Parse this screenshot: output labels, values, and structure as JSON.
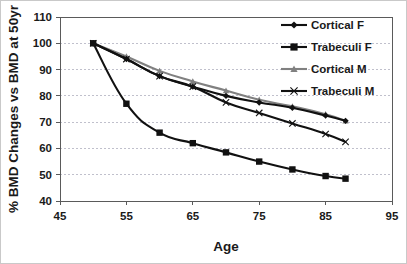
{
  "chart_data": {
    "type": "line",
    "title": "",
    "xlabel": "Age",
    "ylabel": "% BMD Changes vs BMD at 50yr",
    "xlim": [
      45,
      95
    ],
    "ylim": [
      40,
      110
    ],
    "xticks": [
      45,
      55,
      65,
      75,
      85,
      95
    ],
    "yticks": [
      40,
      50,
      60,
      70,
      80,
      90,
      100,
      110
    ],
    "xtick_labels": [
      "45",
      "55",
      "65",
      "75",
      "85",
      "95"
    ],
    "ytick_labels": [
      "40",
      "50",
      "60",
      "70",
      "80",
      "90",
      "100",
      "110"
    ],
    "grid": "horizontal-dotted",
    "legend_position": "top-right",
    "x": [
      50,
      55,
      60,
      65,
      70,
      75,
      80,
      85,
      88
    ],
    "series": [
      {
        "name": "Cortical F",
        "marker": "diamond",
        "color": "#111111",
        "values": [
          100,
          94,
          87.5,
          83.5,
          80,
          77.5,
          75.5,
          72.5,
          70.5
        ]
      },
      {
        "name": "Trabeculi F",
        "marker": "square",
        "color": "#111111",
        "values": [
          100,
          77,
          66,
          62,
          58.5,
          55,
          52,
          49.5,
          48.5
        ]
      },
      {
        "name": "Cortical M",
        "marker": "triangle",
        "color": "#808080",
        "values": [
          100,
          95,
          89.5,
          85.5,
          82,
          78.5,
          76,
          73,
          70.5
        ]
      },
      {
        "name": "Trabeculi M",
        "marker": "x",
        "color": "#111111",
        "values": [
          100,
          94,
          87.5,
          83.5,
          77.5,
          73.5,
          69.5,
          65.5,
          62.5
        ]
      }
    ]
  },
  "legend": {
    "items": [
      {
        "label": "Cortical F"
      },
      {
        "label": "Trabeculi F"
      },
      {
        "label": "Cortical M"
      },
      {
        "label": "Trabeculi M"
      }
    ]
  },
  "axes": {
    "x_title": "Age",
    "y_title": "% BMD Changes vs BMD at 50yr"
  }
}
